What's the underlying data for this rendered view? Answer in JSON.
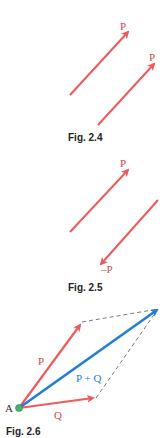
{
  "colors": {
    "vector_red": "#ef5a5a",
    "vector_blue": "#1f7fd6",
    "label_red": "#d8434b",
    "label_blue": "#1f7fd6",
    "point_green": "#4caf7a",
    "dashed": "#555555",
    "caption": "#222222"
  },
  "figures": [
    {
      "caption": "Fig. 2.4",
      "vectors": [
        {
          "label": "P",
          "direction": "up-right"
        },
        {
          "label": "P",
          "direction": "up-right"
        }
      ]
    },
    {
      "caption": "Fig. 2.5",
      "vectors": [
        {
          "label": "P",
          "direction": "up-right"
        },
        {
          "label": "–P",
          "direction": "down-left"
        }
      ]
    },
    {
      "caption": "Fig. 2.6",
      "point_label": "A",
      "vectors": [
        {
          "label": "P"
        },
        {
          "label": "Q"
        },
        {
          "label": "P + Q"
        }
      ]
    }
  ]
}
